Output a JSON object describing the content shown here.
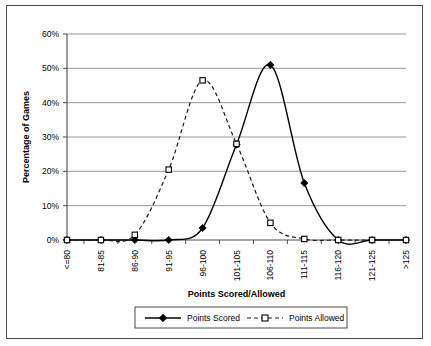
{
  "chart_data": {
    "type": "line",
    "title": "",
    "xlabel": "Points Scored/Allowed",
    "ylabel": "Percentage of Games",
    "categories": [
      "<=80",
      "81-85",
      "86-90",
      "91-95",
      "96-100",
      "101-105",
      "106-110",
      "111-115",
      "116-120",
      "121-125",
      ">125"
    ],
    "series": [
      {
        "name": "Points Scored",
        "marker": "diamond-filled",
        "linestyle": "solid",
        "color": "#000000",
        "values": [
          0,
          0,
          0,
          0,
          3.5,
          27.8,
          51.0,
          16.6,
          0,
          0,
          0
        ]
      },
      {
        "name": "Points Allowed",
        "marker": "square-open",
        "linestyle": "dashed",
        "color": "#000000",
        "values": [
          0,
          0,
          1.5,
          20.5,
          46.5,
          28.0,
          5.0,
          0.3,
          0,
          0,
          0
        ]
      }
    ],
    "ylim": [
      0,
      60
    ],
    "yticks": [
      "0%",
      "10%",
      "20%",
      "30%",
      "40%",
      "50%",
      "60%"
    ],
    "ytick_values": [
      0,
      10,
      20,
      30,
      40,
      50,
      60
    ],
    "grid": "horizontal",
    "legend_position": "bottom"
  },
  "legend": {
    "entries": [
      {
        "label": "Points Scored"
      },
      {
        "label": "Points Allowed"
      }
    ]
  }
}
